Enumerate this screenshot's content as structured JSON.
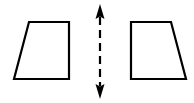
{
  "diagram": {
    "type": "reflection-symmetry",
    "stroke_color": "#000000",
    "background": "#ffffff",
    "left_shape": {
      "name": "trapezoid",
      "points": [
        [
          29,
          22
        ],
        [
          69,
          22
        ],
        [
          69,
          79
        ],
        [
          14,
          79
        ]
      ]
    },
    "axis": {
      "name": "line-of-symmetry",
      "style": "dashed",
      "x": 100,
      "y_start": 5,
      "y_end": 98,
      "arrowheads": "both"
    },
    "right_shape": {
      "name": "trapezoid-mirrored",
      "points": [
        [
          131,
          22
        ],
        [
          171,
          22
        ],
        [
          186,
          79
        ],
        [
          131,
          79
        ]
      ]
    }
  }
}
